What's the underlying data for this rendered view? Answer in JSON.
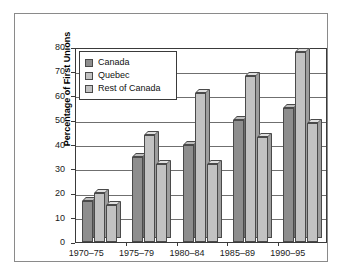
{
  "chart_data": {
    "type": "bar",
    "title": "",
    "subtitle": "",
    "xlabel": "",
    "ylabel": "Percentage of First Unions",
    "categories": [
      "1970–75",
      "1975–79",
      "1980–84",
      "1985–89",
      "1990–95"
    ],
    "series": [
      {
        "name": "Canada",
        "values": [
          17,
          35,
          40,
          50,
          55
        ],
        "color": "#8e8e8e"
      },
      {
        "name": "Quebec",
        "values": [
          20,
          44,
          61,
          68,
          78
        ],
        "color": "#c2c2c2"
      },
      {
        "name": "Rest of Canada",
        "values": [
          15,
          32,
          32,
          43,
          49
        ],
        "color": "#c2c2c2"
      }
    ],
    "ylim": [
      0,
      80
    ],
    "ytick_values": [
      0,
      10,
      20,
      30,
      40,
      50,
      60,
      70,
      80
    ],
    "ytick_labels": [
      "0",
      "10",
      "20",
      "30",
      "40",
      "50",
      "60",
      "70",
      "80"
    ],
    "grid": true,
    "legend_position": "upper-left",
    "style": "3d-bar"
  },
  "legend": {
    "entries": [
      {
        "label": "Canada"
      },
      {
        "label": "Quebec"
      },
      {
        "label": "Rest of Canada"
      }
    ]
  }
}
